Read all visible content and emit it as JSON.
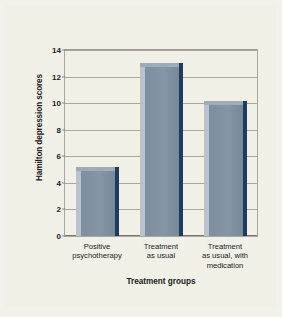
{
  "chart_data": {
    "type": "bar",
    "title": "",
    "xlabel": "Treatment groups",
    "ylabel": "Hamilton depression scores",
    "categories": [
      "Positive\npsychotherapy",
      "Treatment\nas usual",
      "Treatment\nas usual, with\nmedication"
    ],
    "values": [
      5.2,
      13.0,
      10.2
    ],
    "ylim": [
      0,
      14
    ],
    "yticks": [
      0,
      2,
      4,
      6,
      8,
      10,
      12,
      14
    ],
    "ytick_labels": [
      "0",
      "2",
      "4",
      "6",
      "8",
      "10",
      "12",
      "14"
    ],
    "grid": true,
    "legend": false,
    "bar_color": "#7f91a1",
    "bar_edge_color": "#1d3c5e",
    "bar_highlight_color": "#b9c3cb",
    "background_color": "#f1f0e7",
    "grid_color": "#a9a79a",
    "text_color": "#20201c"
  }
}
